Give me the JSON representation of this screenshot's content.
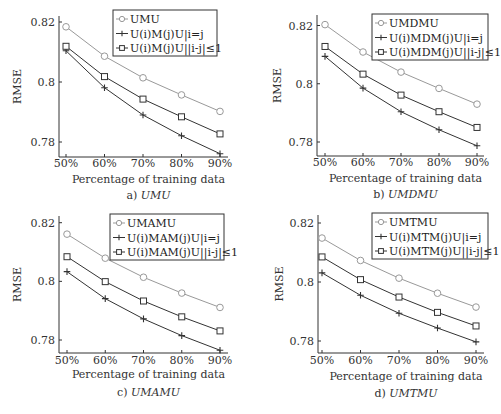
{
  "chart_data": [
    {
      "type": "line",
      "panel": "a",
      "caption_prefix": "a)",
      "caption_name": "UMU",
      "title": "",
      "xlabel": "Percentage of training data",
      "ylabel": "RMSE",
      "x": [
        "50%",
        "60%",
        "70%",
        "80%",
        "90%"
      ],
      "yticks": [
        0.78,
        0.8,
        0.82
      ],
      "ytick_labels": [
        "0.78",
        "0.8",
        "0.82"
      ],
      "ylim": [
        0.775,
        0.822
      ],
      "legend_position": "top-right",
      "series": [
        {
          "name": "UMU",
          "marker": "circle",
          "color": "#999999",
          "values": [
            0.8184,
            0.8086,
            0.8014,
            0.7957,
            0.7902
          ]
        },
        {
          "name": "U(i)M(j)U|i=j",
          "marker": "plus",
          "color": "#333333",
          "values": [
            0.8104,
            0.7981,
            0.789,
            0.7821,
            0.7761
          ]
        },
        {
          "name": "U(i)M(j)U||i-j|≤1",
          "marker": "square",
          "color": "#333333",
          "values": [
            0.8119,
            0.8018,
            0.7943,
            0.7884,
            0.7827
          ]
        }
      ]
    },
    {
      "type": "line",
      "panel": "b",
      "caption_prefix": "b)",
      "caption_name": "UMDMU",
      "title": "",
      "xlabel": "Percentage of training data",
      "ylabel": "RMSE",
      "x": [
        "50%",
        "60%",
        "70%",
        "80%",
        "90%"
      ],
      "yticks": [
        0.78,
        0.8,
        0.82
      ],
      "ytick_labels": [
        "0.78",
        "0.8",
        "0.82"
      ],
      "ylim": [
        0.775,
        0.822
      ],
      "legend_position": "top-right",
      "series": [
        {
          "name": "UMDMU",
          "marker": "circle",
          "color": "#999999",
          "values": [
            0.8203,
            0.8109,
            0.804,
            0.7984,
            0.793
          ]
        },
        {
          "name": "U(i)MDM(j)U|i=j",
          "marker": "plus",
          "color": "#333333",
          "values": [
            0.8094,
            0.7985,
            0.7904,
            0.7842,
            0.7787
          ]
        },
        {
          "name": "U(i)MDM(j)U||i-j|≤1",
          "marker": "square",
          "color": "#333333",
          "values": [
            0.8128,
            0.8033,
            0.7961,
            0.7904,
            0.785
          ]
        }
      ]
    },
    {
      "type": "line",
      "panel": "c",
      "caption_prefix": "c)",
      "caption_name": "UMAMU",
      "title": "",
      "xlabel": "Percentage of training data",
      "ylabel": "RMSE",
      "x": [
        "50%",
        "60%",
        "70%",
        "80%",
        "90%"
      ],
      "yticks": [
        0.78,
        0.8,
        0.82
      ],
      "ytick_labels": [
        "0.78",
        "0.8",
        "0.82"
      ],
      "ylim": [
        0.775,
        0.822
      ],
      "legend_position": "top-right",
      "series": [
        {
          "name": "UMAMU",
          "marker": "circle",
          "color": "#999999",
          "values": [
            0.8161,
            0.8079,
            0.8014,
            0.796,
            0.7911
          ]
        },
        {
          "name": "U(i)MAM(j)U|i=j",
          "marker": "plus",
          "color": "#333333",
          "values": [
            0.8033,
            0.7941,
            0.7872,
            0.7815,
            0.7765
          ]
        },
        {
          "name": "U(i)MAM(j)U||i-j|≤1",
          "marker": "square",
          "color": "#333333",
          "values": [
            0.8084,
            0.7999,
            0.7933,
            0.7879,
            0.7831
          ]
        }
      ]
    },
    {
      "type": "line",
      "panel": "d",
      "caption_prefix": "d)",
      "caption_name": "UMTMU",
      "title": "",
      "xlabel": "Percentage of training data",
      "ylabel": "RMSE",
      "x": [
        "50%",
        "60%",
        "70%",
        "80%",
        "90%"
      ],
      "yticks": [
        0.78,
        0.8,
        0.82
      ],
      "ytick_labels": [
        "0.78",
        "0.8",
        "0.82"
      ],
      "ylim": [
        0.775,
        0.822
      ],
      "legend_position": "top-right",
      "series": [
        {
          "name": "UMTMU",
          "marker": "circle",
          "color": "#999999",
          "values": [
            0.8149,
            0.8073,
            0.8013,
            0.7962,
            0.7915
          ]
        },
        {
          "name": "U(i)MTM(j)U|i=j",
          "marker": "plus",
          "color": "#333333",
          "values": [
            0.8031,
            0.7955,
            0.7894,
            0.7844,
            0.7797
          ]
        },
        {
          "name": "U(i)MTM(j)U||i-j|≤1",
          "marker": "square",
          "color": "#333333",
          "values": [
            0.8085,
            0.8008,
            0.7949,
            0.7897,
            0.7851
          ]
        }
      ]
    }
  ]
}
